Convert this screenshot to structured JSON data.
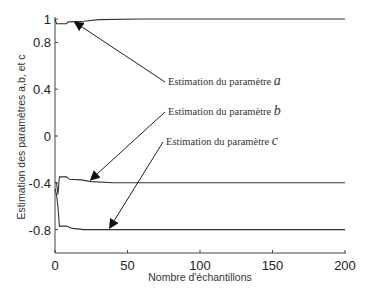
{
  "chart_data": {
    "type": "line",
    "title": "",
    "xlabel": "Nombre d'échantillons",
    "ylabel": "Estimation des paramètres a,b, et c",
    "xlim": [
      0,
      200
    ],
    "ylim": [
      -1,
      1
    ],
    "grid": false,
    "x_ticks": [
      {
        "value": 0,
        "label": "0"
      },
      {
        "value": 50,
        "label": "50"
      },
      {
        "value": 100,
        "label": "100"
      },
      {
        "value": 150,
        "label": "150"
      },
      {
        "value": 200,
        "label": "200"
      }
    ],
    "y_ticks": [
      {
        "value": 1,
        "label": "1"
      },
      {
        "value": 0.8,
        "label": "0.8"
      },
      {
        "value": 0.4,
        "label": "0.4"
      },
      {
        "value": 0,
        "label": "0"
      },
      {
        "value": -0.4,
        "label": "-0.4"
      },
      {
        "value": -0.8,
        "label": "-0.8"
      }
    ],
    "series": [
      {
        "name": "a",
        "points": [
          [
            0,
            1.0
          ],
          [
            1,
            0.96
          ],
          [
            2,
            0.96
          ],
          [
            8,
            0.96
          ],
          [
            9,
            0.975
          ],
          [
            20,
            0.98
          ],
          [
            30,
            0.995
          ],
          [
            60,
            1.0
          ],
          [
            200,
            1.0
          ]
        ]
      },
      {
        "name": "b",
        "points": [
          [
            0,
            -0.4
          ],
          [
            1,
            -0.4
          ],
          [
            2,
            -0.5
          ],
          [
            3,
            -0.35
          ],
          [
            8,
            -0.35
          ],
          [
            10,
            -0.37
          ],
          [
            18,
            -0.375
          ],
          [
            25,
            -0.39
          ],
          [
            40,
            -0.4
          ],
          [
            200,
            -0.4
          ]
        ]
      },
      {
        "name": "c",
        "points": [
          [
            0,
            -0.45
          ],
          [
            1,
            -0.5
          ],
          [
            2,
            -0.6
          ],
          [
            3,
            -0.77
          ],
          [
            8,
            -0.77
          ],
          [
            12,
            -0.79
          ],
          [
            20,
            -0.8
          ],
          [
            200,
            -0.8
          ]
        ]
      }
    ],
    "annotations": [
      {
        "text": "Estimation du paramètre",
        "var": "a",
        "tail": [
          165,
          82
        ],
        "tip_data": [
          14,
          0.97
        ]
      },
      {
        "text": "Estimation du paramètre",
        "var": "b",
        "tail": [
          165,
          112
        ],
        "tip_data": [
          25,
          -0.37
        ]
      },
      {
        "text": "Estimation du paramètre",
        "var": "c",
        "tail": [
          163,
          142
        ],
        "tip_data": [
          38,
          -0.78
        ]
      }
    ]
  }
}
